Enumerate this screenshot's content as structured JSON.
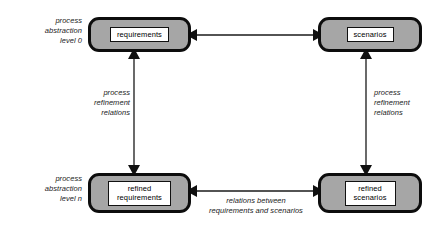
{
  "diagram": {
    "background_color": "#ffffff",
    "node_fill_color": "#a6a6a6",
    "node_border_color": "#0d0d0d",
    "label_fill_color": "#ffffff",
    "connector_color": "#1a1a1a"
  },
  "nodes": [
    {
      "id": "requirements",
      "label": "requirements"
    },
    {
      "id": "scenarios",
      "label": "scenarios"
    },
    {
      "id": "refined_requirements",
      "label": "refined\nrequirements"
    },
    {
      "id": "refined_scenarios",
      "label": "refined\nscenarios"
    }
  ],
  "annotations": {
    "level_0": "process\nabstraction\nlevel 0",
    "level_n": "process\nabstraction\nlevel n",
    "refinement_left": "process\nrefinement\nrelations",
    "refinement_right": "process\nrefinement\nrelations",
    "relations_bottom": "relations between\nrequirements and scenarios"
  },
  "connectors": [
    {
      "id": "top-horizontal",
      "from": "requirements",
      "to": "scenarios",
      "style": "double-arrow",
      "orientation": "horizontal"
    },
    {
      "id": "left-vertical",
      "from": "requirements",
      "to": "refined_requirements",
      "style": "double-arrow",
      "orientation": "vertical"
    },
    {
      "id": "right-vertical",
      "from": "scenarios",
      "to": "refined_scenarios",
      "style": "double-arrow",
      "orientation": "vertical"
    },
    {
      "id": "bottom-horizontal",
      "from": "refined_requirements",
      "to": "refined_scenarios",
      "style": "double-arrow",
      "orientation": "horizontal"
    }
  ]
}
